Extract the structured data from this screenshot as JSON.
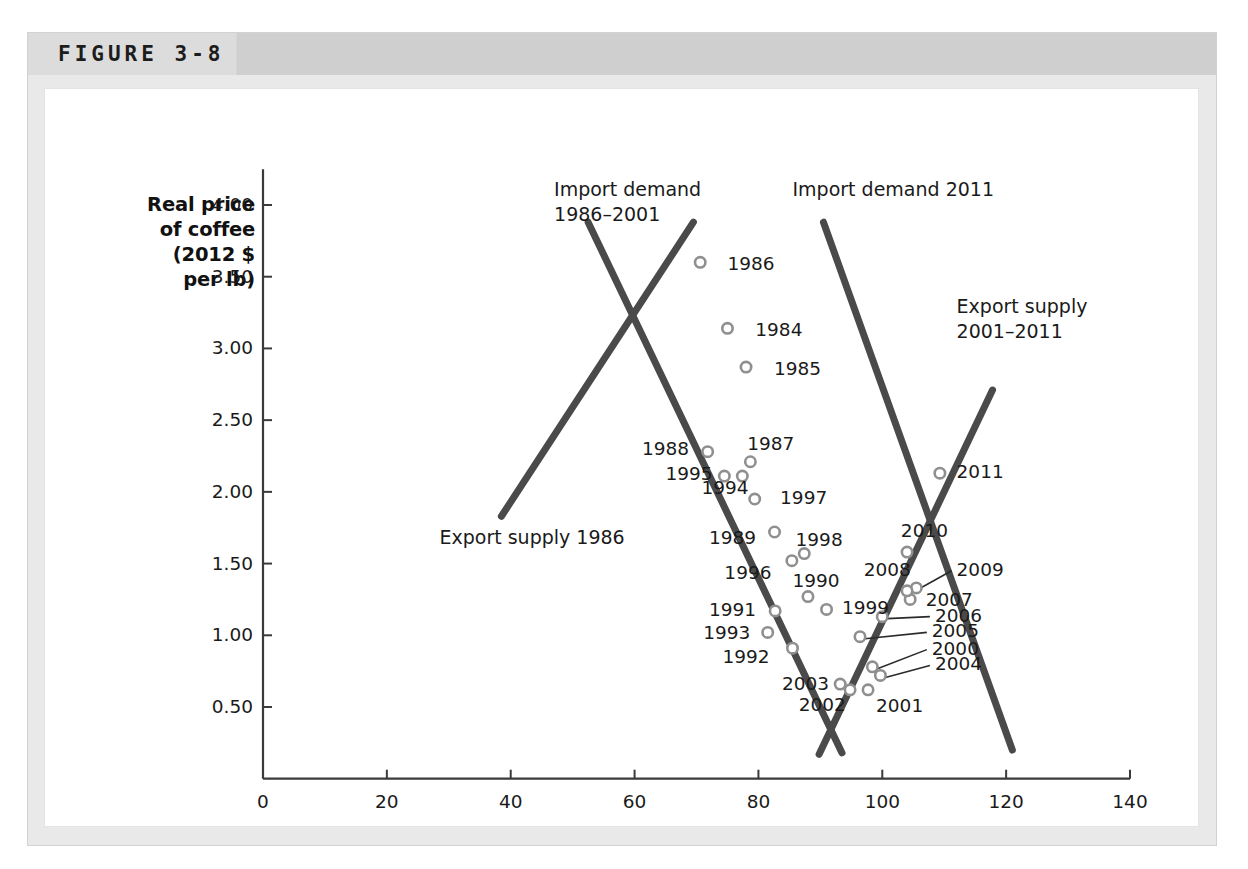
{
  "figure": {
    "label": "FIGURE 3-8"
  },
  "chart_data": {
    "type": "scatter",
    "title": "",
    "xlabel": "Quantity of coffee (millions of 60-kilo bags)",
    "ylabel": "Real price of coffee (2012 $ per lb)",
    "ylabel_lines": [
      "Real price",
      "of coffee",
      "(2012 $",
      "per lb)"
    ],
    "xlim": [
      0,
      140
    ],
    "ylim": [
      0,
      4.25
    ],
    "grid": false,
    "legend_position": "inline-annotations",
    "xticks": [
      0,
      20,
      40,
      60,
      80,
      100,
      120,
      140
    ],
    "xtick_labels": [
      "0",
      "20",
      "40",
      "60",
      "80",
      "100",
      "120",
      "140"
    ],
    "yticks": [
      0.5,
      1.0,
      1.5,
      2.0,
      2.5,
      3.0,
      3.5,
      4.0
    ],
    "ytick_labels": [
      "0.50",
      "1.00",
      "1.50",
      "2.00",
      "2.50",
      "3.00",
      "3.50",
      "4.00"
    ],
    "point_color": "#8f8f8f",
    "line_color": "#4a4a4a",
    "points": [
      {
        "label": "1984",
        "x": 75.0,
        "y": 3.14,
        "lx": 79.5,
        "ly": 3.12,
        "leader": false
      },
      {
        "label": "1985",
        "x": 78.0,
        "y": 2.87,
        "lx": 82.5,
        "ly": 2.85,
        "leader": false
      },
      {
        "label": "1986",
        "x": 70.6,
        "y": 3.6,
        "lx": 75.0,
        "ly": 3.58,
        "leader": false
      },
      {
        "label": "1987",
        "x": 78.7,
        "y": 2.21,
        "lx": 78.2,
        "ly": 2.33,
        "leader": false
      },
      {
        "label": "1988",
        "x": 71.8,
        "y": 2.28,
        "lx": 61.2,
        "ly": 2.29,
        "leader": false
      },
      {
        "label": "1989",
        "x": 82.6,
        "y": 1.72,
        "lx": 72.0,
        "ly": 1.67,
        "leader": false
      },
      {
        "label": "1990",
        "x": 88.0,
        "y": 1.27,
        "lx": 85.5,
        "ly": 1.37,
        "leader": false
      },
      {
        "label": "1991",
        "x": 82.7,
        "y": 1.17,
        "lx": 72.0,
        "ly": 1.17,
        "leader": false
      },
      {
        "label": "1992",
        "x": 85.5,
        "y": 0.91,
        "lx": 74.2,
        "ly": 0.84,
        "leader": false
      },
      {
        "label": "1993",
        "x": 81.5,
        "y": 1.02,
        "lx": 71.1,
        "ly": 1.01,
        "leader": false
      },
      {
        "label": "1994",
        "x": 77.4,
        "y": 2.11,
        "lx": 70.8,
        "ly": 2.02,
        "leader": false
      },
      {
        "label": "1995",
        "x": 74.5,
        "y": 2.11,
        "lx": 65.0,
        "ly": 2.12,
        "leader": false
      },
      {
        "label": "1996",
        "x": 85.4,
        "y": 1.52,
        "lx": 74.5,
        "ly": 1.43,
        "leader": false
      },
      {
        "label": "1997",
        "x": 79.4,
        "y": 1.95,
        "lx": 83.5,
        "ly": 1.95,
        "leader": false
      },
      {
        "label": "1998",
        "x": 87.4,
        "y": 1.57,
        "lx": 86.0,
        "ly": 1.66,
        "leader": false
      },
      {
        "label": "1999",
        "x": 91.0,
        "y": 1.18,
        "lx": 93.5,
        "ly": 1.18,
        "leader": false
      },
      {
        "label": "2000",
        "x": 98.4,
        "y": 0.78,
        "lx": 108.0,
        "ly": 0.9,
        "leader": true
      },
      {
        "label": "2001",
        "x": 97.7,
        "y": 0.62,
        "lx": 99.0,
        "ly": 0.5,
        "leader": false
      },
      {
        "label": "2002",
        "x": 94.8,
        "y": 0.62,
        "lx": 86.5,
        "ly": 0.51,
        "leader": false
      },
      {
        "label": "2003",
        "x": 93.2,
        "y": 0.66,
        "lx": 83.8,
        "ly": 0.65,
        "leader": false
      },
      {
        "label": "2004",
        "x": 99.7,
        "y": 0.72,
        "lx": 108.5,
        "ly": 0.79,
        "leader": true
      },
      {
        "label": "2005",
        "x": 96.4,
        "y": 0.99,
        "lx": 108.0,
        "ly": 1.02,
        "leader": true
      },
      {
        "label": "2006",
        "x": 100.0,
        "y": 1.13,
        "lx": 108.5,
        "ly": 1.13,
        "leader": true
      },
      {
        "label": "2007",
        "x": 104.5,
        "y": 1.25,
        "lx": 107.0,
        "ly": 1.24,
        "leader": false
      },
      {
        "label": "2008",
        "x": 105.5,
        "y": 1.33,
        "lx": 97.0,
        "ly": 1.45,
        "leader": false
      },
      {
        "label": "2009",
        "x": 104.0,
        "y": 1.31,
        "lx": 112.0,
        "ly": 1.45,
        "leader": true
      },
      {
        "label": "2010",
        "x": 104.0,
        "y": 1.58,
        "lx": 103.0,
        "ly": 1.72,
        "leader": false
      },
      {
        "label": "2011",
        "x": 109.3,
        "y": 2.13,
        "lx": 112.0,
        "ly": 2.13,
        "leader": false
      }
    ],
    "curves": [
      {
        "name": "import-demand-1986-2001",
        "label_lines": [
          "Import demand",
          "1986–2001"
        ],
        "label_x": 47.0,
        "label_y": 4.1,
        "x1": 52.5,
        "y1": 3.88,
        "x2": 93.5,
        "y2": 0.18
      },
      {
        "name": "export-supply-1986",
        "label_lines": [
          "Export supply 1986"
        ],
        "label_x": 28.5,
        "label_y": 1.67,
        "x1": 38.5,
        "y1": 1.83,
        "x2": 69.5,
        "y2": 3.88
      },
      {
        "name": "import-demand-2011",
        "label_lines": [
          "Import demand 2011"
        ],
        "label_x": 85.5,
        "label_y": 4.1,
        "x1": 90.5,
        "y1": 3.88,
        "x2": 121.0,
        "y2": 0.2
      },
      {
        "name": "export-supply-2001-2011",
        "label_lines": [
          "Export supply",
          "2001–2011"
        ],
        "label_x": 112.0,
        "label_y": 3.28,
        "x1": 89.8,
        "y1": 0.17,
        "x2": 117.8,
        "y2": 2.71
      }
    ]
  }
}
